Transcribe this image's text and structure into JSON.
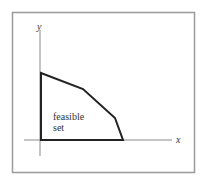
{
  "diagram": {
    "axes": {
      "x_label": "x",
      "y_label": "y"
    },
    "region_label_line1": "feasible",
    "region_label_line2": "set",
    "polygon_vertices": [
      [
        41,
        140
      ],
      [
        41,
        73
      ],
      [
        83,
        89
      ],
      [
        115,
        118
      ],
      [
        123,
        140
      ]
    ],
    "colors": {
      "frame": "#9a9a9a",
      "axis": "#8a8a8a",
      "region_edge": "#222222",
      "text": "#333333"
    }
  }
}
